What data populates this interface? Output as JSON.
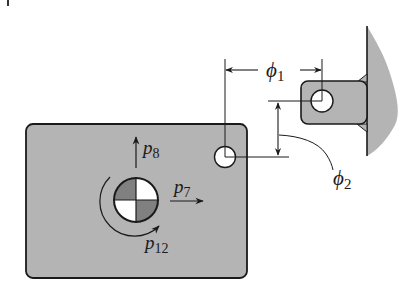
{
  "diagram": {
    "type": "mechanical-schematic",
    "colors": {
      "fill": "#b4b4b4",
      "stroke": "#1a1a1a",
      "background": "#ffffff",
      "hole": "#ffffff",
      "com_dark": "#808080",
      "com_light": "#ffffff"
    },
    "labels": {
      "p8": {
        "base": "p",
        "sub": "8"
      },
      "p7": {
        "base": "p",
        "sub": "7"
      },
      "p12": {
        "base": "p",
        "sub": "12"
      },
      "phi1": {
        "base": "ϕ",
        "sub": "1"
      },
      "phi2": {
        "base": "ϕ",
        "sub": "2"
      }
    },
    "nodes": [
      {
        "id": "plate",
        "label": "rigid plate"
      },
      {
        "id": "com",
        "label": "center of mass marker"
      },
      {
        "id": "plate-hole",
        "label": "plate hole"
      },
      {
        "id": "lug",
        "label": "bracket lug"
      },
      {
        "id": "lug-hole",
        "label": "lug hole"
      },
      {
        "id": "wall",
        "label": "fixed wall"
      }
    ],
    "edges": [
      {
        "from": "plate-hole",
        "to": "lug-hole",
        "label": "ϕ1",
        "kind": "horizontal dimension"
      },
      {
        "from": "plate-hole",
        "to": "lug-hole",
        "label": "ϕ2",
        "kind": "vertical dimension"
      },
      {
        "from": "lug",
        "to": "wall",
        "label": "",
        "kind": "weld"
      }
    ]
  }
}
